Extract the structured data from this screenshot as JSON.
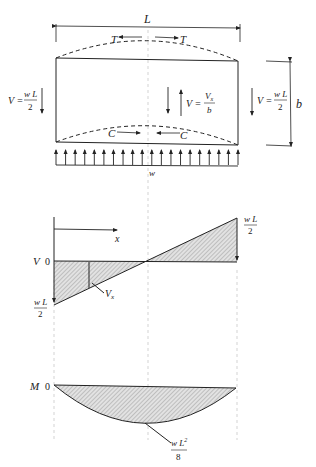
{
  "beam": {
    "span_label": "L",
    "depth_label": "b",
    "tension_label": "T",
    "compression_label": "C",
    "load_label": "w",
    "load_arrow_count": 20,
    "left_shear": {
      "lhs": "V =",
      "num": "w L",
      "den": "2"
    },
    "right_shear": {
      "lhs": "V =",
      "num": "w L",
      "den": "2"
    },
    "center_shear": {
      "lhs": "V =",
      "num": "V",
      "num_sub": "x",
      "den": "b"
    }
  },
  "shear_diagram": {
    "axis_label": "V",
    "zero_label": "0",
    "x_label": "x",
    "top_value": {
      "num": "w L",
      "den": "2"
    },
    "bottom_value": {
      "num": "w L",
      "den": "2"
    },
    "section_label": "V",
    "section_sub": "x"
  },
  "moment_diagram": {
    "axis_label": "M",
    "zero_label": "0",
    "max_value": {
      "num": "w L",
      "sup": "2",
      "den": "8"
    }
  },
  "colors": {
    "line": "#222222",
    "hatch": "#bdbdbd",
    "guide": "#c8c8c8"
  }
}
